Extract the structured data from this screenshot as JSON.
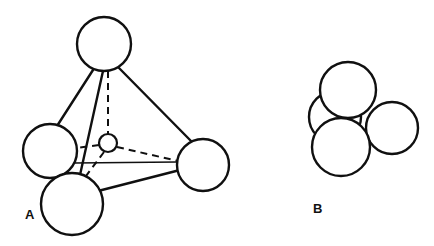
{
  "figure": {
    "background_color": "#ffffff",
    "stroke_color": "#101010",
    "sphere_fill": "#ffffff",
    "width": 434,
    "height": 246,
    "panels": [
      {
        "id": "A",
        "label": "A",
        "label_x": 25,
        "label_y": 219,
        "type": "tetrahedral-ball-and-stick",
        "spheres": [
          {
            "name": "sphere-top",
            "cx": 104,
            "cy": 44,
            "r": 27,
            "stroke_width": 2.4
          },
          {
            "name": "sphere-left",
            "cx": 50,
            "cy": 151,
            "r": 27,
            "stroke_width": 2.4
          },
          {
            "name": "sphere-bottom",
            "cx": 72,
            "cy": 204,
            "r": 31,
            "stroke_width": 2.4
          },
          {
            "name": "sphere-right",
            "cx": 203,
            "cy": 165,
            "r": 26,
            "stroke_width": 2.4
          },
          {
            "name": "sphere-interstitial-center",
            "cx": 108,
            "cy": 143,
            "r": 9,
            "stroke_width": 2.2
          }
        ],
        "solid_bonds": [
          {
            "name": "bond-top-left",
            "x1": 93,
            "y1": 70,
            "x2": 57,
            "y2": 126,
            "stroke_width": 2.4
          },
          {
            "name": "bond-top-bottom",
            "x1": 103,
            "y1": 71,
            "x2": 80,
            "y2": 175,
            "stroke_width": 2.4
          },
          {
            "name": "bond-top-right",
            "x1": 119,
            "y1": 68,
            "x2": 192,
            "y2": 142,
            "stroke_width": 2.4
          },
          {
            "name": "bond-bottom-right",
            "x1": 98,
            "y1": 191,
            "x2": 180,
            "y2": 170,
            "stroke_width": 2.4
          },
          {
            "name": "bond-left-right-behind",
            "x1": 74,
            "y1": 163,
            "x2": 177,
            "y2": 162,
            "stroke_width": 1.5
          }
        ],
        "dashed_bonds": [
          {
            "name": "bond-top-center-hidden",
            "x1": 108,
            "y1": 71,
            "x2": 108,
            "y2": 134,
            "stroke_width": 2.0,
            "dash": "7 5"
          },
          {
            "name": "bond-center-left-hidden",
            "x1": 99,
            "y1": 145,
            "x2": 62,
            "y2": 150,
            "stroke_width": 2.0,
            "dash": "7 5"
          },
          {
            "name": "bond-center-right-hidden",
            "x1": 117,
            "y1": 147,
            "x2": 178,
            "y2": 161,
            "stroke_width": 2.0,
            "dash": "7 5"
          },
          {
            "name": "bond-center-bottom-hidden",
            "x1": 104,
            "y1": 152,
            "x2": 83,
            "y2": 180,
            "stroke_width": 2.0,
            "dash": "7 5"
          }
        ]
      },
      {
        "id": "B",
        "label": "B",
        "label_x": 313,
        "label_y": 213,
        "type": "tetrahedral-close-packed",
        "spheres": [
          {
            "name": "sphere-back-left",
            "cx": 335,
            "cy": 117,
            "r": 26,
            "stroke_width": 2.4
          },
          {
            "name": "sphere-top",
            "cx": 348,
            "cy": 90,
            "r": 28,
            "stroke_width": 2.4
          },
          {
            "name": "sphere-right",
            "cx": 392,
            "cy": 128,
            "r": 26,
            "stroke_width": 2.4
          },
          {
            "name": "sphere-front",
            "cx": 341,
            "cy": 147,
            "r": 29,
            "stroke_width": 2.4
          }
        ]
      }
    ]
  }
}
